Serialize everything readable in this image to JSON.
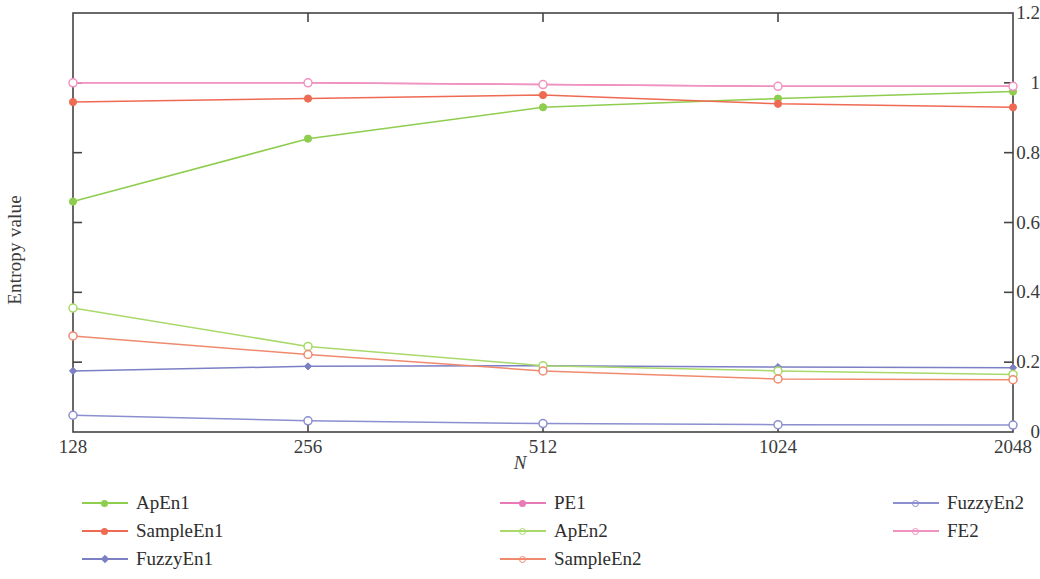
{
  "chart_data": {
    "type": "line",
    "title": "",
    "xlabel": "N",
    "ylabel": "Entropy value",
    "x": [
      128,
      256,
      512,
      1024,
      2048
    ],
    "xtick_labels": [
      "128",
      "256",
      "512",
      "1024",
      "2048"
    ],
    "xscale": "log2",
    "ytick_labels": [
      "0",
      "0.2",
      "0.4",
      "0.6",
      "0.8",
      "1",
      "1.2"
    ],
    "ytick_values": [
      0,
      0.2,
      0.4,
      0.6,
      0.8,
      1.0,
      1.2
    ],
    "ylim": [
      0,
      1.2
    ],
    "grid": false,
    "legend_position": "below",
    "legend_columns": 3,
    "series": [
      {
        "name": "ApEn1",
        "color": "#8ecd4e",
        "marker": "filled-circle",
        "legend_column": 1,
        "values": [
          0.66,
          0.84,
          0.93,
          0.955,
          0.975
        ]
      },
      {
        "name": "SampleEn1",
        "color": "#ef6a52",
        "marker": "filled-circle",
        "legend_column": 1,
        "values": [
          0.945,
          0.955,
          0.965,
          0.94,
          0.93
        ]
      },
      {
        "name": "FuzzyEn1",
        "color": "#7b7fc4",
        "marker": "filled-diamond",
        "legend_column": 1,
        "values": [
          0.175,
          0.188,
          0.19,
          0.186,
          0.184
        ]
      },
      {
        "name": "PE1",
        "color": "#e87ab5",
        "marker": "filled-circle",
        "legend_column": 2,
        "values": [
          1.0,
          1.0,
          0.995,
          0.99,
          0.99
        ]
      },
      {
        "name": "ApEn2",
        "color": "#a8d96a",
        "marker": "open-circle",
        "legend_column": 2,
        "values": [
          0.355,
          0.245,
          0.19,
          0.175,
          0.165
        ]
      },
      {
        "name": "SampleEn2",
        "color": "#f08a6f",
        "marker": "open-circle",
        "legend_column": 2,
        "values": [
          0.275,
          0.222,
          0.175,
          0.152,
          0.15
        ]
      },
      {
        "name": "FuzzyEn2",
        "color": "#8b8fd0",
        "marker": "open-circle",
        "legend_column": 3,
        "values": [
          0.048,
          0.032,
          0.024,
          0.021,
          0.02
        ]
      },
      {
        "name": "FE2",
        "color": "#f093c0",
        "marker": "open-circle",
        "legend_column": 3,
        "values": [
          1.0,
          1.0,
          0.995,
          0.99,
          0.99
        ]
      }
    ]
  },
  "axes": {
    "frame_color": "#444444"
  },
  "legend": {
    "columns": [
      {
        "items": [
          "ApEn1",
          "SampleEn1",
          "FuzzyEn1"
        ]
      },
      {
        "items": [
          "PE1",
          "ApEn2",
          "SampleEn2"
        ]
      },
      {
        "items": [
          "FuzzyEn2",
          "FE2"
        ]
      }
    ]
  }
}
